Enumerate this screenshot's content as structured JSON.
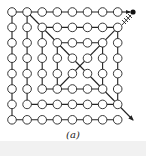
{
  "figure": {
    "caption": "(a)",
    "grid": {
      "cols": 8,
      "rows": 8,
      "x0": 12,
      "y0": 12,
      "dx": 15.1,
      "dy": 15.4,
      "circle_radius": 4.3
    },
    "colors": {
      "stroke": "#222222",
      "background": "#ffffff",
      "band": "#f1f1f1"
    },
    "end_dot": {
      "x": 133,
      "y": 12
    },
    "diagonal_end": {
      "x": 133,
      "y": 120
    }
  }
}
